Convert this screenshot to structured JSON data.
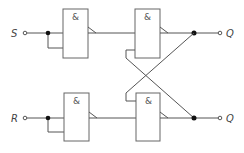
{
  "diagram": {
    "type": "logic-circuit",
    "inputs": [
      {
        "label": "S"
      },
      {
        "label": "R"
      }
    ],
    "outputs": [
      {
        "label": "Q"
      },
      {
        "label": "Q"
      }
    ],
    "gates": [
      {
        "id": "gate-top-left",
        "symbol": "&"
      },
      {
        "id": "gate-top-right",
        "symbol": "&"
      },
      {
        "id": "gate-bottom-left",
        "symbol": "&"
      },
      {
        "id": "gate-bottom-right",
        "symbol": "&"
      }
    ],
    "colors": {
      "wire": "#555555",
      "gate_border": "#666666",
      "junction": "#111111",
      "background": "#ffffff"
    }
  }
}
